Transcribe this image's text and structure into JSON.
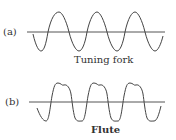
{
  "panels": [
    {
      "tag": "(a)",
      "caption": "Tuning fork",
      "waveform": "pure sine"
    },
    {
      "tag": "(b)",
      "caption": "Flute",
      "waveform": "complex periodic with harmonics"
    }
  ],
  "colors": {
    "line": "#444444",
    "background": "#ffffff"
  }
}
